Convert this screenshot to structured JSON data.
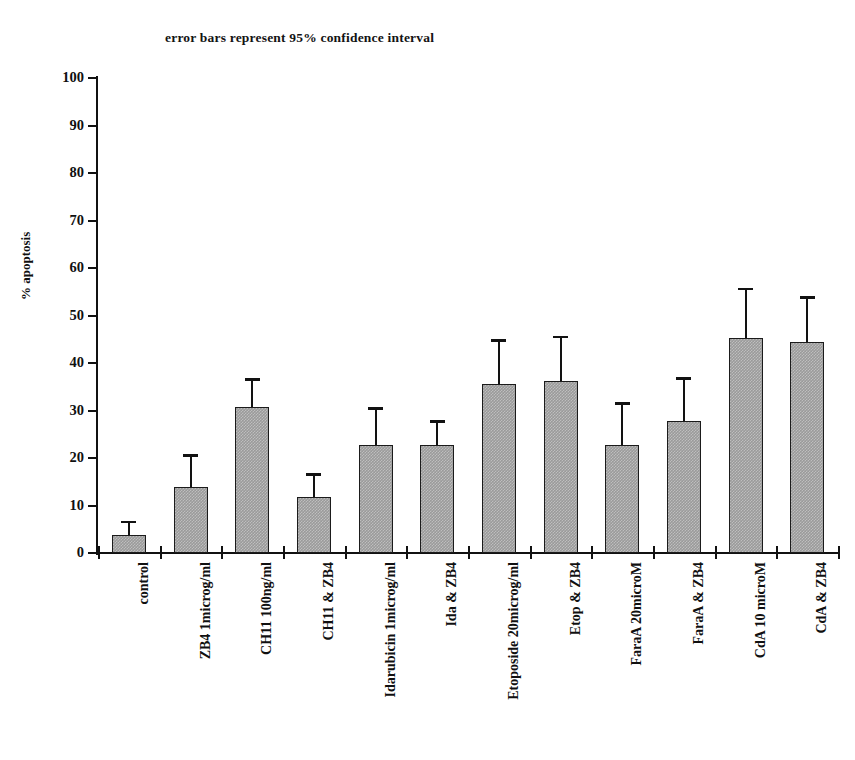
{
  "chart_data": {
    "type": "bar",
    "title": "error bars represent 95% confidence interval",
    "xlabel": "",
    "ylabel": "% apoptosis",
    "ylim": [
      0,
      100
    ],
    "yticks": [
      0,
      10,
      20,
      30,
      40,
      50,
      60,
      70,
      80,
      90,
      100
    ],
    "grid": false,
    "legend": false,
    "error_bars": "95% confidence interval (upper shown)",
    "categories": [
      "control",
      "ZB4 1microg/ml",
      "CH11 100ng/ml",
      "CH11 & ZB4",
      "Idarubicin 1microg/ml",
      "Ida & ZB4",
      "Etoposide 20microg/ml",
      "Etop & ZB4",
      "FaraA 20microM",
      "FaraA & ZB4",
      "CdA 10 microM",
      "CdA & ZB4"
    ],
    "values": [
      3.8,
      14.0,
      30.7,
      11.8,
      22.7,
      22.7,
      35.5,
      36.2,
      22.7,
      27.7,
      45.3,
      44.5
    ],
    "error_upper": [
      6.3,
      20.3,
      36.3,
      16.3,
      30.2,
      27.4,
      44.5,
      45.2,
      31.2,
      36.5,
      55.3,
      53.5
    ],
    "bar_color": "#9a9a9a",
    "bar_edge_color": "#1b1b1b",
    "error_color": "#121212",
    "axis_color": "#111111",
    "background": "#ffffff"
  }
}
